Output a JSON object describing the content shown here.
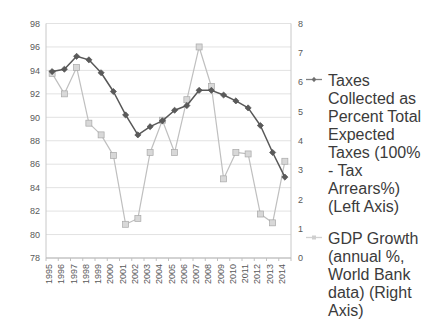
{
  "chart_data": {
    "type": "line",
    "title": "",
    "xlabel": "",
    "ylabel": "",
    "grid": true,
    "legend_position": "right",
    "categories": [
      "1995",
      "1996",
      "1997",
      "1998",
      "1999",
      "2000",
      "2001",
      "2002",
      "2003",
      "2004",
      "2005",
      "2006",
      "2007",
      "2008",
      "2009",
      "2010",
      "2011",
      "2012",
      "2013",
      "2014"
    ],
    "left_axis": {
      "label": "Taxes Collected as Percent Total Expected Taxes",
      "ylim": [
        78,
        98
      ],
      "ticks": [
        78,
        80,
        82,
        84,
        86,
        88,
        90,
        92,
        94,
        96,
        98
      ]
    },
    "right_axis": {
      "label": "GDP Growth (annual %)",
      "ylim": [
        0,
        8
      ],
      "ticks": [
        0,
        1,
        2,
        3,
        4,
        5,
        6,
        7,
        8
      ]
    },
    "series": [
      {
        "name": "Taxes Collected as Percent Total Expected Taxes (100% - Tax Arrears%) (Left Axis)",
        "axis": "left",
        "color": "#585858",
        "marker": "diamond",
        "values": [
          93.9,
          94.1,
          95.2,
          94.9,
          93.8,
          92.2,
          90.2,
          88.5,
          89.2,
          89.7,
          90.6,
          91.0,
          92.3,
          92.3,
          91.9,
          91.4,
          90.8,
          89.3,
          87.0,
          84.9
        ]
      },
      {
        "name": "GDP Growth (annual %, World Bank data) (Right Axis)",
        "axis": "right",
        "color": "#bfbfbf",
        "marker": "square",
        "values": [
          6.3,
          5.6,
          6.5,
          4.6,
          4.2,
          3.5,
          1.15,
          1.35,
          3.6,
          4.7,
          3.6,
          5.4,
          7.2,
          5.85,
          2.7,
          3.6,
          3.55,
          1.5,
          1.2,
          3.3
        ]
      }
    ]
  },
  "legend": {
    "entries": [
      {
        "label": "Taxes Collected as Percent Total Expected Taxes (100% - Tax Arrears%) (Left Axis)",
        "color": "#808080",
        "marker": "diamond"
      },
      {
        "label": "GDP Growth (annual %, World Bank data) (Right Axis)",
        "color": "#cfcfcf",
        "marker": "square"
      }
    ]
  },
  "axis_labels": {
    "left": [
      "98",
      "96",
      "94",
      "92",
      "90",
      "88",
      "86",
      "84",
      "82",
      "80",
      "78"
    ],
    "right": [
      "8",
      "7",
      "6",
      "5",
      "4",
      "3",
      "2",
      "1",
      "0"
    ],
    "x": [
      "1995",
      "1996",
      "1997",
      "1998",
      "1999",
      "2000",
      "2001",
      "2002",
      "2003",
      "2004",
      "2005",
      "2006",
      "2007",
      "2008",
      "2009",
      "2010",
      "2011",
      "2012",
      "2013",
      "2014"
    ]
  },
  "colors": {
    "taxes_line": "#585858",
    "gdp_line": "#bfbfbf",
    "grid": "#e2e2e2",
    "axis": "#c8c8c8",
    "text": "#595959"
  }
}
